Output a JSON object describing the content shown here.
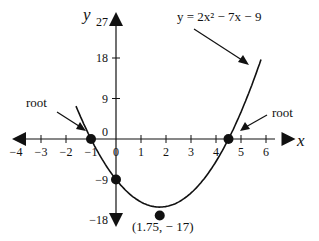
{
  "chart_data": {
    "type": "line",
    "title": "",
    "equation_label": "y = 2x² − 7x − 9",
    "xlabel": "x",
    "ylabel": "y",
    "xlim": [
      -4,
      7
    ],
    "ylim": [
      -18,
      27
    ],
    "x_ticks": [
      -4,
      -3,
      -2,
      -1,
      0,
      1,
      2,
      3,
      4,
      5,
      6
    ],
    "x_tick_labels": [
      "−4",
      "−3",
      "−2",
      "−1",
      "0",
      "1",
      "2",
      "3",
      "4",
      "5",
      "6"
    ],
    "y_ticks": [
      27,
      18,
      9,
      0,
      -9,
      -18
    ],
    "y_tick_labels": [
      "27",
      "18",
      "9",
      "0",
      "−9",
      "−18"
    ],
    "function": {
      "a": 2,
      "b": -7,
      "c": -9,
      "x_range": [
        -1.6,
        5.8
      ]
    },
    "points": [
      {
        "name": "root-left",
        "x": -1,
        "y": 0,
        "label": "root"
      },
      {
        "name": "root-right",
        "x": 4.5,
        "y": 0,
        "label": "root"
      },
      {
        "name": "y-intercept",
        "x": 0,
        "y": -9,
        "label": ""
      },
      {
        "name": "vertex",
        "x": 1.75,
        "y": -17,
        "label": "(1.75, − 17)"
      }
    ],
    "grid": false,
    "line_color": "#111111"
  }
}
